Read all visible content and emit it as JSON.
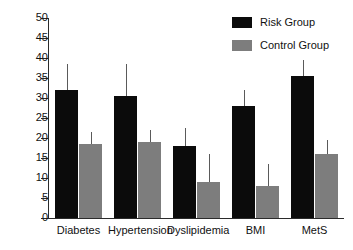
{
  "chart_data": {
    "type": "bar",
    "title": "",
    "subtitle": "",
    "xlabel": "",
    "ylabel": "",
    "categories": [
      "Diabetes",
      "Hypertension",
      "Dyslipidemia",
      "BMI",
      "MetS"
    ],
    "series": [
      {
        "name": "Risk Group",
        "color": "#0b0b0b",
        "values": [
          32,
          30.5,
          18,
          28,
          35.5
        ],
        "error_upper": [
          38.5,
          38.5,
          22.5,
          32,
          39.5
        ]
      },
      {
        "name": "Control Group",
        "color": "#7d7d7d",
        "values": [
          18.5,
          19,
          9,
          8,
          16
        ],
        "error_upper": [
          21.5,
          22,
          16,
          13.5,
          19.5
        ]
      }
    ],
    "ylim": [
      0,
      50
    ],
    "ytick_step": 5,
    "ytick_labels": [
      "0",
      "5",
      "10",
      "15",
      "20",
      "25",
      "30",
      "35",
      "40",
      "45",
      "50"
    ],
    "grid": false,
    "legend_position": "top-right",
    "error_bar_style": "upper-only-no-cap"
  },
  "legend": {
    "entries": [
      {
        "label": "Risk Group"
      },
      {
        "label": "Control Group"
      }
    ]
  }
}
